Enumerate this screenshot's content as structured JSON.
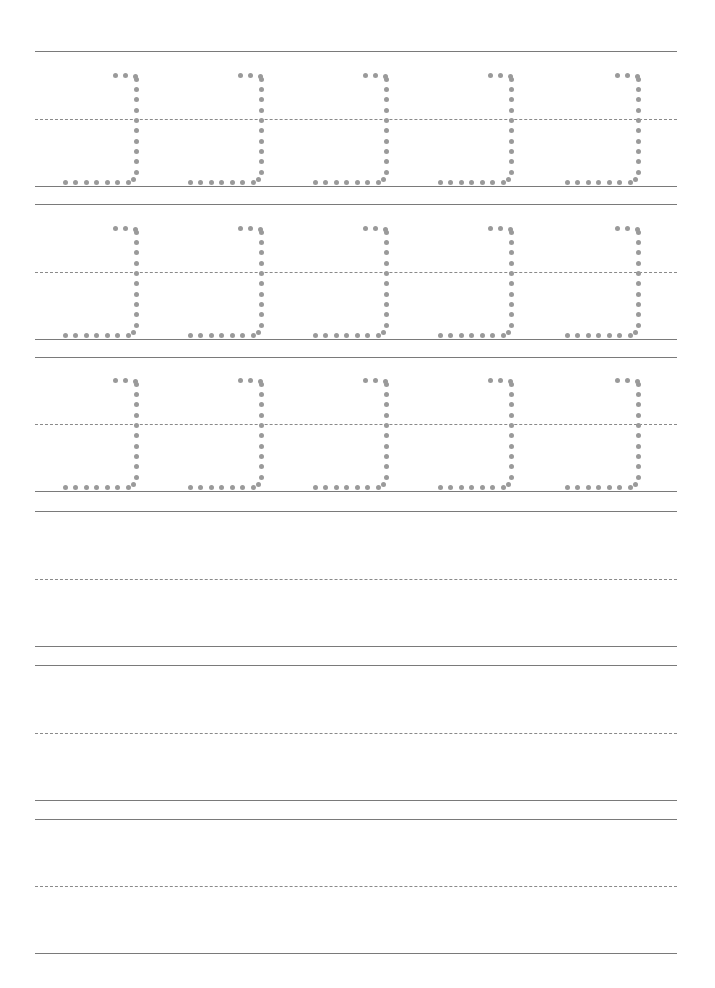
{
  "worksheet": {
    "type": "handwriting-tracing-practice",
    "letter": "ב",
    "colors": {
      "line": "#7a7a7a",
      "midline": "#8a8a8a",
      "dots": "#9a9a9a"
    },
    "traced_rows": [
      {
        "top": 51,
        "mid": 119,
        "base": 186,
        "letters": 5
      },
      {
        "top": 204,
        "mid": 272,
        "base": 339,
        "letters": 5
      },
      {
        "top": 357,
        "mid": 424,
        "base": 491,
        "letters": 5
      }
    ],
    "blank_rows": [
      {
        "top": 511,
        "mid": 579,
        "base": 646
      },
      {
        "top": 665,
        "mid": 733,
        "base": 800
      },
      {
        "top": 819,
        "mid": 886,
        "base": 953
      }
    ],
    "columns_x": [
      65,
      190,
      315,
      440,
      567
    ]
  }
}
